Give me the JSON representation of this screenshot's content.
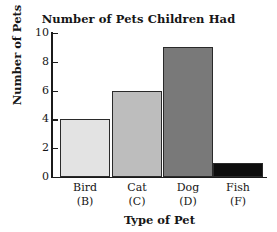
{
  "chart_data": {
    "type": "bar",
    "title": "Number of Pets Children Had",
    "xlabel": "Type of Pet",
    "ylabel": "Number of Pets",
    "categories": [
      "Bird",
      "Cat",
      "Dog",
      "Fish"
    ],
    "category_codes": [
      "(B)",
      "(C)",
      "(D)",
      "(F)"
    ],
    "values": [
      4,
      6,
      9,
      1
    ],
    "ylim": [
      0,
      10
    ],
    "ytick_labels": [
      "0",
      "2",
      "4",
      "6",
      "8",
      "10"
    ],
    "ytick_values": [
      0,
      2,
      4,
      6,
      8,
      10
    ],
    "grid": false,
    "legend": "none",
    "bar_colors": [
      "#e3e3e3",
      "#bdbdbd",
      "#797979",
      "#0d0d0d"
    ],
    "bar_edge_color": "#2a2a2a",
    "axis_color": "#1b1b1b",
    "background_color": "#ffffff"
  }
}
